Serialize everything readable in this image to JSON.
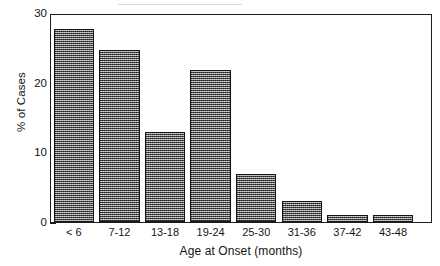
{
  "chart_data": {
    "type": "bar",
    "title": "",
    "subtitle": "",
    "xlabel": "Age at Onset (months)",
    "ylabel": "% of Cases",
    "categories": [
      "< 6",
      "7-12",
      "13-18",
      "19-24",
      "25-30",
      "31-36",
      "37-42",
      "43-48"
    ],
    "values": [
      28,
      25,
      13,
      22,
      7,
      3,
      1,
      1
    ],
    "series": [
      {
        "name": "% of Cases",
        "values": [
          28,
          25,
          13,
          22,
          7,
          3,
          1,
          1
        ]
      }
    ],
    "ylim": [
      0,
      30
    ],
    "xlim_categories": 8,
    "y_major_ticks": [
      0,
      10,
      20,
      30
    ],
    "y_major_tick_labels": [
      "0",
      "10",
      "20",
      "30"
    ],
    "y_minor_tick_interval": 2,
    "y_minor_ticks": [
      2,
      4,
      6,
      8,
      12,
      14,
      16,
      18,
      22,
      24,
      26,
      28
    ],
    "grid": false,
    "legend": null,
    "legend_position": "none",
    "annotations": [],
    "bar_fill": "dithered-gray-checkerboard",
    "bar_outline_color": "#151515",
    "colors": {
      "bar_fill": "#6f6f6f",
      "bar_outline": "#151515",
      "axis": "#1d1d1d",
      "text": "#141414",
      "background": "#ffffff"
    }
  },
  "axes": {
    "y_title": "% of Cases",
    "x_title": "Age at Onset (months)",
    "y_tick_labels": [
      "30",
      "20",
      "10",
      "0"
    ],
    "x_tick_labels": [
      "< 6",
      "7-12",
      "13-18",
      "19-24",
      "25-30",
      "31-36",
      "37-42",
      "43-48"
    ]
  }
}
